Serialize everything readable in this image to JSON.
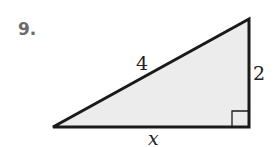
{
  "problem": {
    "number": "9."
  },
  "triangle": {
    "type": "right-triangle",
    "hypotenuse_label": "4",
    "vertical_leg_label": "2",
    "horizontal_leg_label": "x",
    "right_angle_position": "bottom-right",
    "fill_color": "#ececec",
    "stroke_color": "#1a1a1a"
  }
}
